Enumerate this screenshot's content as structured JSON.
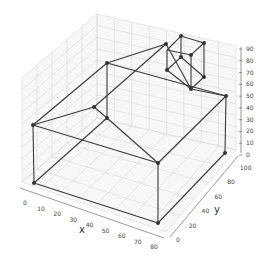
{
  "chart_data": {
    "type": "line3d",
    "title": "",
    "xlabel": "x",
    "ylabel": "y",
    "zlabel": "",
    "xlim": [
      0,
      80
    ],
    "ylim": [
      0,
      100
    ],
    "zlim": [
      0,
      90
    ],
    "x_ticks": [
      "0",
      "10",
      "20",
      "30",
      "40",
      "50",
      "60",
      "70",
      "80"
    ],
    "y_ticks": [
      "0",
      "20",
      "40",
      "60",
      "80",
      "100"
    ],
    "z_ticks": [
      "0",
      "10",
      "20",
      "30",
      "40",
      "50",
      "60",
      "70",
      "80",
      "90"
    ],
    "grid": true,
    "vertices": [
      {
        "name": "base-0",
        "xyz": [
          0,
          0,
          0
        ]
      },
      {
        "name": "base-1",
        "xyz": [
          80,
          0,
          0
        ]
      },
      {
        "name": "base-2",
        "xyz": [
          80,
          100,
          0
        ]
      },
      {
        "name": "base-3",
        "xyz": [
          0,
          100,
          0
        ]
      },
      {
        "name": "wall-top-0",
        "xyz": [
          0,
          0,
          50
        ]
      },
      {
        "name": "wall-top-1",
        "xyz": [
          80,
          0,
          50
        ]
      },
      {
        "name": "wall-top-2",
        "xyz": [
          80,
          100,
          50
        ]
      },
      {
        "name": "wall-top-3",
        "xyz": [
          0,
          100,
          50
        ]
      },
      {
        "name": "ridge-front",
        "xyz": [
          40,
          0,
          90
        ]
      },
      {
        "name": "ridge-back",
        "xyz": [
          40,
          100,
          90
        ]
      },
      {
        "name": "chimney-0",
        "xyz": [
          40,
          70,
          90
        ]
      },
      {
        "name": "chimney-1",
        "xyz": [
          55,
          70,
          90
        ]
      },
      {
        "name": "chimney-2",
        "xyz": [
          55,
          90,
          90
        ]
      },
      {
        "name": "chimney-3",
        "xyz": [
          40,
          90,
          90
        ]
      },
      {
        "name": "chimney-4",
        "xyz": [
          40,
          70,
          70
        ]
      },
      {
        "name": "chimney-5",
        "xyz": [
          55,
          70,
          70
        ]
      },
      {
        "name": "chimney-6",
        "xyz": [
          55,
          90,
          70
        ]
      },
      {
        "name": "chimney-7",
        "xyz": [
          40,
          90,
          70
        ]
      }
    ]
  },
  "labels": {
    "x": "x",
    "y": "y"
  }
}
